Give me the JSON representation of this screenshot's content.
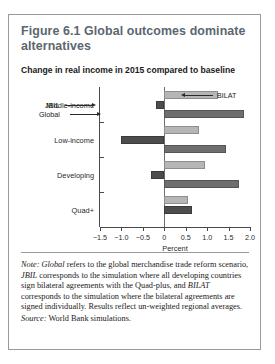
{
  "figure": {
    "title": "Figure 6.1  Global outcomes dominate alternatives",
    "subtitle": "Change in real income in 2015 compared to baseline",
    "note_label": "Note:",
    "note_text": " refers to the global merchandise trade reform scenario, ",
    "note_text2": " corresponds to the simulation where all developing countries sign bilateral agreements with the Quad-plus, and ",
    "note_text3": " corresponds to the simulation where the bilateral agreements are signed individually. Results reflect un-weighted regional averages.",
    "note_term1": "Global",
    "note_term2": "JBIL",
    "note_term3": "BILAT",
    "source_label": "Source:",
    "source_text": " World Bank simulations."
  },
  "annotations": {
    "bilat": "BILAT",
    "jbil": "JBIL",
    "global": "Global"
  },
  "chart_data": {
    "type": "bar",
    "orientation": "horizontal",
    "title": "Change in real income in 2015 compared to baseline",
    "xlabel": "Percent",
    "ylabel": "",
    "xlim": [
      -1.5,
      2.0
    ],
    "xticks": [
      -1.5,
      -1.0,
      -0.5,
      0,
      0.5,
      1.0,
      1.5,
      2.0
    ],
    "xtick_labels": [
      "−1.5",
      "−1.0",
      "−0.5",
      "0",
      "0.5",
      "1.0",
      "1.5",
      "2.0"
    ],
    "grid": false,
    "legend": "annotated-inline",
    "categories": [
      "Middle-income",
      "Low-income",
      "Developing",
      "Quad+"
    ],
    "series": [
      {
        "name": "BILAT",
        "color": "#b6b6b6",
        "values": [
          1.25,
          0.8,
          0.95,
          0.55
        ]
      },
      {
        "name": "JBIL",
        "color": "#4d4d4d",
        "values": [
          -0.2,
          -1.0,
          -0.3,
          0.65
        ]
      },
      {
        "name": "Global",
        "color": "#6e6e6e",
        "values": [
          1.85,
          1.45,
          1.75,
          0.0
        ]
      }
    ]
  }
}
